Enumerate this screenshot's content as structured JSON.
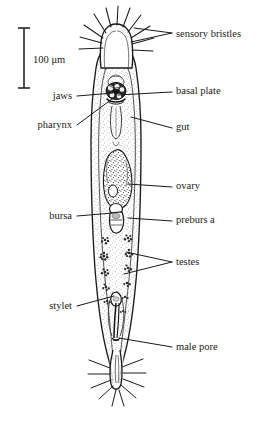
{
  "figure": {
    "kind": "anatomical-diagram",
    "background_color": "#ffffff",
    "ink_color": "#1a1a1a",
    "width": 262,
    "height": 422
  },
  "scale_bar": {
    "label": "100 μm",
    "x": 24,
    "y_top": 28,
    "y_bottom": 88,
    "text_x": 33,
    "text_y": 61
  },
  "labels": [
    {
      "id": "sensory-bristles",
      "text": "sensory bristles",
      "side": "right",
      "text_x": 176,
      "text_y": 35,
      "leaders": [
        {
          "x1": 172,
          "y1": 33,
          "x2": 131,
          "y2": 42
        },
        {
          "x1": 172,
          "y1": 33,
          "x2": 134,
          "y2": 28
        }
      ]
    },
    {
      "id": "basal-plate",
      "text": "basal plate",
      "side": "right",
      "text_x": 176,
      "text_y": 92,
      "leaders": [
        {
          "x1": 172,
          "y1": 92,
          "x2": 118,
          "y2": 95
        }
      ]
    },
    {
      "id": "gut",
      "text": "gut",
      "side": "right",
      "text_x": 176,
      "text_y": 128,
      "leaders": [
        {
          "x1": 172,
          "y1": 128,
          "x2": 131,
          "y2": 117
        }
      ]
    },
    {
      "id": "ovary",
      "text": "ovary",
      "side": "right",
      "text_x": 176,
      "text_y": 187,
      "leaders": [
        {
          "x1": 172,
          "y1": 187,
          "x2": 128,
          "y2": 184
        }
      ]
    },
    {
      "id": "preburs a",
      "text": "preburs a",
      "side": "right",
      "text_x": 176,
      "text_y": 221,
      "leaders": [
        {
          "x1": 172,
          "y1": 221,
          "x2": 128,
          "y2": 218
        }
      ]
    },
    {
      "id": "testes",
      "text": "testes",
      "side": "right",
      "text_x": 176,
      "text_y": 263,
      "leaders": [
        {
          "x1": 172,
          "y1": 262,
          "x2": 126,
          "y2": 252
        },
        {
          "x1": 172,
          "y1": 262,
          "x2": 124,
          "y2": 274
        }
      ]
    },
    {
      "id": "male-pore",
      "text": "male pore",
      "side": "right",
      "text_x": 176,
      "text_y": 348,
      "leaders": [
        {
          "x1": 172,
          "y1": 347,
          "x2": 119,
          "y2": 338
        }
      ]
    },
    {
      "id": "jaws",
      "text": "jaws",
      "side": "left",
      "text_x": 72,
      "text_y": 97,
      "leaders": [
        {
          "x1": 77,
          "y1": 96,
          "x2": 113,
          "y2": 93
        }
      ]
    },
    {
      "id": "pharynx",
      "text": "pharynx",
      "side": "left",
      "text_x": 72,
      "text_y": 126,
      "leaders": [
        {
          "x1": 77,
          "y1": 125,
          "x2": 112,
          "y2": 99
        }
      ]
    },
    {
      "id": "bursa",
      "text": "bursa",
      "side": "left",
      "text_x": 72,
      "text_y": 217,
      "leaders": [
        {
          "x1": 77,
          "y1": 216,
          "x2": 113,
          "y2": 213
        }
      ]
    },
    {
      "id": "stylet",
      "text": "stylet",
      "side": "left",
      "text_x": 72,
      "text_y": 307,
      "leaders": [
        {
          "x1": 77,
          "y1": 306,
          "x2": 114,
          "y2": 296
        }
      ]
    }
  ],
  "anatomy": {
    "body_outline_name": "worm-body-outline",
    "head_name": "head-region",
    "tail_name": "tail-region",
    "organs": [
      "jaws",
      "basal-plate",
      "pharynx",
      "gut",
      "ovary",
      "preburs a",
      "bursa",
      "testes",
      "stylet",
      "male-pore"
    ]
  }
}
